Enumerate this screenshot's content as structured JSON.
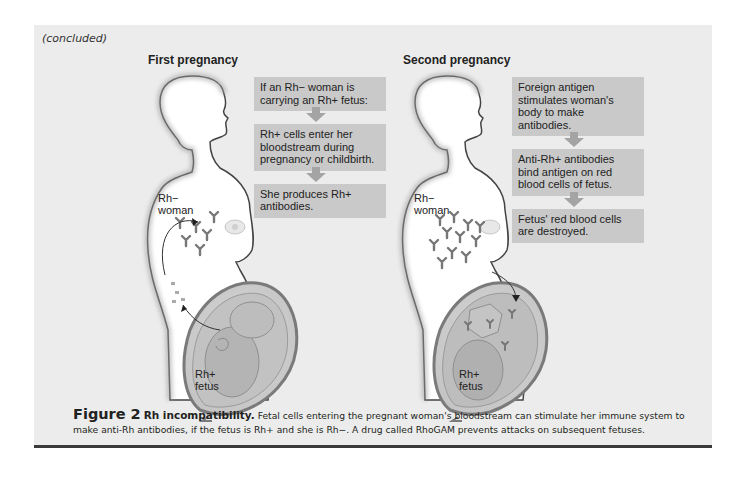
{
  "header": {
    "continuation": "(concluded)"
  },
  "panels": [
    {
      "title": "First pregnancy",
      "woman_label": {
        "line1": "Rh−",
        "line2": "woman"
      },
      "fetus_label": {
        "line1": "Rh+",
        "line2": "fetus"
      },
      "flow": [
        "If an Rh− woman is carrying an Rh+ fetus:",
        "Rh+ cells enter her bloodstream during pregnancy or childbirth.",
        "She produces Rh+ antibodies."
      ]
    },
    {
      "title": "Second pregnancy",
      "woman_label": {
        "line1": "Rh−",
        "line2": "woman"
      },
      "fetus_label": {
        "line1": "Rh+",
        "line2": "fetus"
      },
      "flow": [
        "Foreign antigen stimulates woman's body to make antibodies.",
        "Anti-Rh+ antibodies bind antigen on red blood cells of fetus.",
        "Fetus' red blood cells are destroyed."
      ]
    }
  ],
  "caption": {
    "figure_number": "Figure 2",
    "title": "Rh incompatibility.",
    "text": "Fetal cells entering the pregnant woman's bloodstream can stimulate her immune system to make anti-Rh antibodies, if the fetus is Rh+ and she is Rh−. A drug called RhoGAM prevents attacks on subsequent fetuses."
  },
  "colors": {
    "panel_bg": "#ececec",
    "box_bg": "#c9c9c9",
    "arrow": "#a4a4a4",
    "rule": "#3a3a3a",
    "uterus": "#8a8a8a",
    "fetus": "#b8b8b8"
  },
  "icons": [
    "woman-silhouette-icon",
    "antibody-y-icon",
    "fetus-in-uterus-icon",
    "curved-arrow-icon",
    "down-arrow-icon"
  ]
}
